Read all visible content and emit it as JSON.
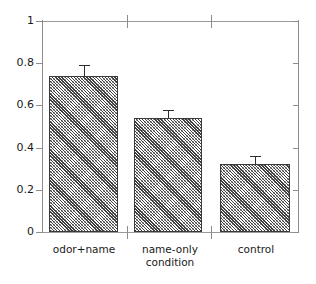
{
  "chart_data": {
    "type": "bar",
    "title": "",
    "subtitle": "",
    "xlabel": "condition",
    "ylabel": "",
    "categories": [
      "odor+name",
      "name-only\ncondition",
      "control"
    ],
    "category_labels_flat": [
      "odor+name",
      "name-only condition",
      "control"
    ],
    "values": [
      0.74,
      0.54,
      0.32
    ],
    "errors": [
      0.05,
      0.04,
      0.04
    ],
    "error_type": "standard error bars",
    "ylim": [
      0,
      1
    ],
    "yticks": [
      0,
      0.2,
      0.4,
      0.6,
      0.8,
      1
    ],
    "ytick_labels": [
      "0",
      "0.2",
      "0.4",
      "0.6",
      "0.8",
      "1"
    ],
    "grid": false,
    "legend": null,
    "legend_position": "none",
    "bar_fill": "diagonal-hatch",
    "bar_edge_color": "#3a3a3a",
    "axis_color": "#8c8c8c",
    "background": "#ffffff"
  },
  "axis": {
    "y": {
      "ticks": [
        {
          "label": "1",
          "value": 1.0
        },
        {
          "label": "0.8",
          "value": 0.8
        },
        {
          "label": "0.6",
          "value": 0.6
        },
        {
          "label": "0.4",
          "value": 0.4
        },
        {
          "label": "0.2",
          "value": 0.2
        },
        {
          "label": "0",
          "value": 0.0
        }
      ]
    }
  }
}
